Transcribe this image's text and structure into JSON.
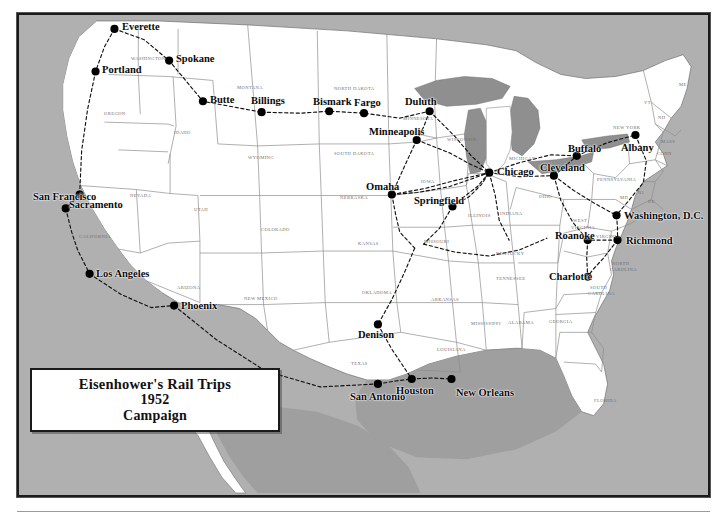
{
  "title": {
    "line1": "Eisenhower's Rail Trips",
    "line2": "1952",
    "line3": "Campaign"
  },
  "colors": {
    "ocean": "#b0b0b0",
    "land": "#ffffff",
    "lakes": "#8f8f8f",
    "border": "#1a1a1a",
    "state_line": "#8c8c8c",
    "route": "#111111",
    "city_dot": "#000000",
    "state_text": "#6e6e6e",
    "city_text": "#0a0a0a"
  },
  "map": {
    "region": "Continental United States",
    "legend_present": false
  },
  "cities": [
    {
      "name": "Everette",
      "x": 113,
      "y": 27,
      "lx": 122,
      "ly": 22,
      "anchor": "left"
    },
    {
      "name": "Spokane",
      "x": 168,
      "y": 59,
      "lx": 176,
      "ly": 54,
      "anchor": "left"
    },
    {
      "name": "Portland",
      "x": 94,
      "y": 70,
      "lx": 102,
      "ly": 65,
      "anchor": "left"
    },
    {
      "name": "Butte",
      "x": 202,
      "y": 100,
      "lx": 210,
      "ly": 95,
      "anchor": "left"
    },
    {
      "name": "Billings",
      "x": 261,
      "y": 111,
      "lx": 251,
      "ly": 96,
      "anchor": "left"
    },
    {
      "name": "Bismark",
      "x": 329,
      "y": 110,
      "lx": 313,
      "ly": 97,
      "anchor": "left"
    },
    {
      "name": "Fargo",
      "x": 364,
      "y": 112,
      "lx": 354,
      "ly": 98,
      "anchor": "left"
    },
    {
      "name": "Duluth",
      "x": 430,
      "y": 110,
      "lx": 405,
      "ly": 97,
      "anchor": "left"
    },
    {
      "name": "Minneapolis",
      "x": 417,
      "y": 139,
      "lx": 369,
      "ly": 127,
      "anchor": "left"
    },
    {
      "name": "Omaha",
      "x": 392,
      "y": 194,
      "lx": 366,
      "ly": 182,
      "anchor": "left"
    },
    {
      "name": "Chicago",
      "x": 490,
      "y": 172,
      "lx": 497,
      "ly": 167,
      "anchor": "left"
    },
    {
      "name": "Springfield",
      "x": 453,
      "y": 206,
      "lx": 414,
      "ly": 196,
      "anchor": "left"
    },
    {
      "name": "Cleveland",
      "x": 555,
      "y": 175,
      "lx": 540,
      "ly": 163,
      "anchor": "left"
    },
    {
      "name": "Buffalo",
      "x": 578,
      "y": 155,
      "lx": 568,
      "ly": 144,
      "anchor": "left"
    },
    {
      "name": "Albany",
      "x": 637,
      "y": 134,
      "lx": 621,
      "ly": 143,
      "anchor": "left"
    },
    {
      "name": "Washington, D.C.",
      "x": 618,
      "y": 215,
      "lx": 624,
      "ly": 211,
      "anchor": "left"
    },
    {
      "name": "Richmond",
      "x": 619,
      "y": 240,
      "lx": 626,
      "ly": 236,
      "anchor": "left"
    },
    {
      "name": "Roanoke",
      "x": 589,
      "y": 240,
      "lx": 555,
      "ly": 231,
      "anchor": "left"
    },
    {
      "name": "Charlotte",
      "x": 589,
      "y": 277,
      "lx": 549,
      "ly": 272,
      "anchor": "left"
    },
    {
      "name": "San Francisco",
      "x": 64,
      "y": 208,
      "lx": 33,
      "ly": 192,
      "anchor": "left"
    },
    {
      "name": "Sacramento",
      "x": 78,
      "y": 194,
      "lx": 69,
      "ly": 200,
      "anchor": "left"
    },
    {
      "name": "Los Angeles",
      "x": 88,
      "y": 274,
      "lx": 96,
      "ly": 269,
      "anchor": "left"
    },
    {
      "name": "Phoenix",
      "x": 173,
      "y": 306,
      "lx": 181,
      "ly": 301,
      "anchor": "left"
    },
    {
      "name": "Denison",
      "x": 378,
      "y": 325,
      "lx": 358,
      "ly": 330,
      "anchor": "left"
    },
    {
      "name": "San Antonio",
      "x": 378,
      "y": 385,
      "lx": 350,
      "ly": 392,
      "anchor": "left"
    },
    {
      "name": "Houston",
      "x": 412,
      "y": 380,
      "lx": 396,
      "ly": 386,
      "anchor": "left"
    },
    {
      "name": "New Orleans",
      "x": 452,
      "y": 380,
      "lx": 456,
      "ly": 388,
      "anchor": "left"
    }
  ],
  "states": [
    {
      "name": "WASHINGTON",
      "x": 131,
      "y": 57,
      "size": "sm"
    },
    {
      "name": "OREGON",
      "x": 104,
      "y": 112,
      "size": "sm"
    },
    {
      "name": "IDAHO",
      "x": 174,
      "y": 131,
      "size": "sm"
    },
    {
      "name": "MONTANA",
      "x": 237,
      "y": 86,
      "size": "sm"
    },
    {
      "name": "WYOMING",
      "x": 248,
      "y": 156,
      "size": "sm"
    },
    {
      "name": "NEVADA",
      "x": 130,
      "y": 194,
      "size": "sm"
    },
    {
      "name": "CALIFORNIA",
      "x": 79,
      "y": 235,
      "size": "sm"
    },
    {
      "name": "UTAH",
      "x": 194,
      "y": 208,
      "size": "sm"
    },
    {
      "name": "COLORADO",
      "x": 261,
      "y": 228,
      "size": "sm"
    },
    {
      "name": "ARIZONA",
      "x": 177,
      "y": 286,
      "size": "sm"
    },
    {
      "name": "NEW MEXICO",
      "x": 244,
      "y": 297,
      "size": "sm"
    },
    {
      "name": "NORTH DAKOTA",
      "x": 334,
      "y": 87,
      "size": "sm"
    },
    {
      "name": "SOUTH DAKOTA",
      "x": 334,
      "y": 152,
      "size": "sm"
    },
    {
      "name": "NEBRASKA",
      "x": 340,
      "y": 196,
      "size": "sm"
    },
    {
      "name": "KANSAS",
      "x": 358,
      "y": 242,
      "size": "sm"
    },
    {
      "name": "OKLAHOMA",
      "x": 362,
      "y": 291,
      "size": "sm"
    },
    {
      "name": "TEXAS",
      "x": 351,
      "y": 362,
      "size": "sm"
    },
    {
      "name": "MINNESOTA",
      "x": 403,
      "y": 117,
      "size": "sm"
    },
    {
      "name": "IOWA",
      "x": 421,
      "y": 180,
      "size": "sm"
    },
    {
      "name": "MISSOURI",
      "x": 424,
      "y": 240,
      "size": "sm"
    },
    {
      "name": "ARKANSAS",
      "x": 431,
      "y": 298,
      "size": "sm"
    },
    {
      "name": "LOUISIANA",
      "x": 437,
      "y": 348,
      "size": "sm"
    },
    {
      "name": "WISCONSIN",
      "x": 447,
      "y": 138,
      "size": "sm"
    },
    {
      "name": "ILLINOIS",
      "x": 468,
      "y": 214,
      "size": "sm"
    },
    {
      "name": "INDIANA",
      "x": 500,
      "y": 212,
      "size": "sm"
    },
    {
      "name": "MICHIGAN",
      "x": 509,
      "y": 157,
      "size": "sm"
    },
    {
      "name": "OHIO",
      "x": 539,
      "y": 195,
      "size": "sm"
    },
    {
      "name": "KENTUCKY",
      "x": 496,
      "y": 252,
      "size": "sm"
    },
    {
      "name": "TENNESSEE",
      "x": 496,
      "y": 277,
      "size": "sm"
    },
    {
      "name": "MISSISSIPPI",
      "x": 471,
      "y": 322,
      "size": "sm"
    },
    {
      "name": "ALABAMA",
      "x": 508,
      "y": 321,
      "size": "sm"
    },
    {
      "name": "GEORGIA",
      "x": 549,
      "y": 320,
      "size": "sm"
    },
    {
      "name": "FLORIDA",
      "x": 594,
      "y": 399,
      "size": "sm"
    },
    {
      "name": "WEST",
      "x": 573,
      "y": 219,
      "size": "sm"
    },
    {
      "name": "VIRGINIA",
      "x": 571,
      "y": 226,
      "size": "sm"
    },
    {
      "name": "VIRGINIA",
      "x": 596,
      "y": 235,
      "size": "sm"
    },
    {
      "name": "NORTH",
      "x": 612,
      "y": 262,
      "size": "sm"
    },
    {
      "name": "CAROLINA",
      "x": 610,
      "y": 268,
      "size": "sm"
    },
    {
      "name": "SOUTH",
      "x": 590,
      "y": 286,
      "size": "sm"
    },
    {
      "name": "CAROLINA",
      "x": 588,
      "y": 292,
      "size": "sm"
    },
    {
      "name": "PENNSYLVANIA",
      "x": 597,
      "y": 178,
      "size": "sm"
    },
    {
      "name": "NEW YORK",
      "x": 613,
      "y": 126,
      "size": "sm"
    },
    {
      "name": "ME",
      "x": 679,
      "y": 83,
      "size": "sm"
    },
    {
      "name": "VT",
      "x": 644,
      "y": 101,
      "size": "sm"
    },
    {
      "name": "NH",
      "x": 658,
      "y": 116,
      "size": "sm"
    },
    {
      "name": "MASS",
      "x": 661,
      "y": 140,
      "size": "sm"
    },
    {
      "name": "CONN",
      "x": 657,
      "y": 152,
      "size": "sm"
    },
    {
      "name": "NJ",
      "x": 638,
      "y": 191,
      "size": "sm"
    },
    {
      "name": "DE",
      "x": 648,
      "y": 200,
      "size": "sm"
    },
    {
      "name": "MD",
      "x": 620,
      "y": 196,
      "size": "sm"
    }
  ],
  "routes": [
    {
      "id": "pacific-northwest",
      "points": "113,27 143,38 168,59 202,100 261,111"
    },
    {
      "id": "puget-to-portland",
      "points": "113,27 103,45 94,70"
    },
    {
      "id": "west-coast-south",
      "points": "94,70 86,108 80,150 78,194 64,208 70,232 76,250 88,274"
    },
    {
      "id": "socal-to-phoenix",
      "points": "88,274 120,295 150,308 173,306"
    },
    {
      "id": "phoenix-to-texas",
      "points": "173,306 215,340 265,372 320,388 378,385"
    },
    {
      "id": "northern-plains",
      "points": "261,111 300,112 329,110 364,112 400,117 430,110"
    },
    {
      "id": "duluth-minneapolis",
      "points": "430,110 424,126 417,139"
    },
    {
      "id": "minneapolis-chicago",
      "points": "417,139 450,152 470,163 490,172"
    },
    {
      "id": "duluth-chicago",
      "points": "430,110 455,135 472,155 490,172"
    },
    {
      "id": "omaha-chicago",
      "points": "392,194 425,188 455,180 490,172"
    },
    {
      "id": "minneapolis-omaha",
      "points": "417,139 405,165 392,194"
    },
    {
      "id": "omaha-kansas",
      "points": "392,194 396,215 400,232 415,248"
    },
    {
      "id": "springfield-chicago",
      "points": "453,206 470,196 482,184 490,172"
    },
    {
      "id": "springfield-stlouis",
      "points": "453,206 440,228 424,244"
    },
    {
      "id": "chicago-cleveland",
      "points": "490,172 520,176 555,175"
    },
    {
      "id": "cleveland-buffalo",
      "points": "555,175 568,164 578,155"
    },
    {
      "id": "buffalo-albany",
      "points": "578,155 608,142 637,134"
    },
    {
      "id": "chicago-buffalo-north",
      "points": "490,172 520,162 552,154 578,155"
    },
    {
      "id": "albany-nyc-dc",
      "points": "637,134 648,160 645,182 632,198 618,215"
    },
    {
      "id": "cleveland-dc",
      "points": "555,175 575,190 596,203 618,215"
    },
    {
      "id": "dc-richmond",
      "points": "618,215 619,228 619,240"
    },
    {
      "id": "richmond-roanoke",
      "points": "619,240 604,240 589,240"
    },
    {
      "id": "roanoke-charlotte",
      "points": "589,240 588,258 589,277"
    },
    {
      "id": "richmond-charlotte",
      "points": "619,240 605,258 594,270 589,277"
    },
    {
      "id": "cleveland-roanoke",
      "points": "555,175 562,200 574,222 589,240"
    },
    {
      "id": "chicago-indiana-south",
      "points": "490,172 496,195 500,220 510,240"
    },
    {
      "id": "midwest-kentucky",
      "points": "424,244 455,252 490,256 520,250 548,238"
    },
    {
      "id": "kansas-denison",
      "points": "415,248 405,272 392,300 378,325"
    },
    {
      "id": "denison-houston",
      "points": "378,325 392,350 404,368 412,380"
    },
    {
      "id": "houston-neworleans",
      "points": "412,380 432,379 452,380"
    },
    {
      "id": "sanantonio-houston",
      "points": "378,385 396,382 412,380"
    },
    {
      "id": "chicago-springfield-loop",
      "points": "490,172 478,186 465,196 453,206"
    },
    {
      "id": "iowa-chicago",
      "points": "392,194 418,192 450,186 490,172"
    }
  ]
}
